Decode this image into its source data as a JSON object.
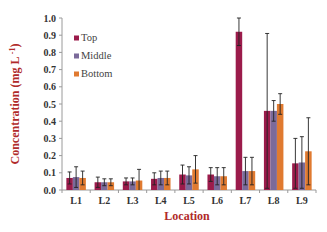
{
  "chart_data": {
    "type": "bar",
    "title": "",
    "xlabel": "Location",
    "ylabel": "Concentration (mg L",
    "ylabel_sup": "-1",
    "ylabel_close": ")",
    "ylim": [
      0,
      1.0
    ],
    "yticks": [
      "0.0",
      "0.1",
      "0.2",
      "0.3",
      "0.4",
      "0.5",
      "0.6",
      "0.7",
      "0.8",
      "0.9",
      "1.0"
    ],
    "grid": false,
    "legend_position": "upper-left-inside",
    "categories": [
      "L1",
      "L2",
      "L3",
      "L4",
      "L5",
      "L6",
      "L7",
      "L8",
      "L9"
    ],
    "series": [
      {
        "name": "Top",
        "color": "#9b1b4b",
        "values": [
          0.07,
          0.045,
          0.05,
          0.065,
          0.09,
          0.09,
          0.92,
          0.46,
          0.155
        ],
        "error_upper": [
          0.105,
          0.075,
          0.07,
          0.1,
          0.145,
          0.13,
          1.0,
          0.91,
          0.3
        ]
      },
      {
        "name": "Middle",
        "color": "#7b6a9a",
        "values": [
          0.075,
          0.045,
          0.05,
          0.07,
          0.085,
          0.08,
          0.11,
          0.46,
          0.16
        ],
        "error_upper": [
          0.135,
          0.065,
          0.07,
          0.11,
          0.135,
          0.13,
          0.19,
          0.52,
          0.31
        ]
      },
      {
        "name": "Bottom",
        "color": "#e07a30",
        "values": [
          0.07,
          0.045,
          0.055,
          0.07,
          0.12,
          0.08,
          0.11,
          0.5,
          0.225
        ],
        "error_upper": [
          0.11,
          0.065,
          0.12,
          0.11,
          0.2,
          0.13,
          0.19,
          0.56,
          0.42
        ]
      }
    ]
  }
}
